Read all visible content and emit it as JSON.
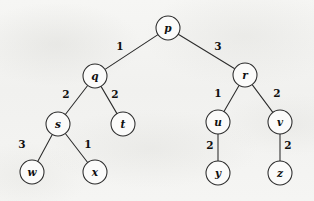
{
  "figure": {
    "type": "tree-diagram",
    "title": "",
    "background_color": "#f3f3f1",
    "stroke_color": "#2b2b2b",
    "node_fill_color": "#fbfbfa",
    "node_radius": 12
  },
  "nodes": [
    {
      "id": "p",
      "label": "p",
      "x": 168,
      "y": 28
    },
    {
      "id": "q",
      "label": "q",
      "x": 95,
      "y": 76
    },
    {
      "id": "r",
      "label": "r",
      "x": 245,
      "y": 75
    },
    {
      "id": "s",
      "label": "s",
      "x": 58,
      "y": 124
    },
    {
      "id": "t",
      "label": "t",
      "x": 123,
      "y": 124
    },
    {
      "id": "u",
      "label": "u",
      "x": 218,
      "y": 122
    },
    {
      "id": "v",
      "label": "v",
      "x": 280,
      "y": 122
    },
    {
      "id": "w",
      "label": "w",
      "x": 32,
      "y": 172
    },
    {
      "id": "x",
      "label": "x",
      "x": 95,
      "y": 172
    },
    {
      "id": "y",
      "label": "y",
      "x": 218,
      "y": 173
    },
    {
      "id": "z",
      "label": "z",
      "x": 280,
      "y": 173
    }
  ],
  "edges": [
    {
      "from": "p",
      "to": "q",
      "weight": "1",
      "label_x": 120,
      "label_y": 47
    },
    {
      "from": "p",
      "to": "r",
      "weight": "3",
      "label_x": 218,
      "label_y": 47
    },
    {
      "from": "q",
      "to": "s",
      "weight": "2",
      "label_x": 66,
      "label_y": 95
    },
    {
      "from": "q",
      "to": "t",
      "weight": "2",
      "label_x": 115,
      "label_y": 95
    },
    {
      "from": "r",
      "to": "u",
      "weight": "1",
      "label_x": 218,
      "label_y": 94
    },
    {
      "from": "r",
      "to": "v",
      "weight": "2",
      "label_x": 277,
      "label_y": 94
    },
    {
      "from": "s",
      "to": "w",
      "weight": "3",
      "label_x": 22,
      "label_y": 145
    },
    {
      "from": "s",
      "to": "x",
      "weight": "1",
      "label_x": 88,
      "label_y": 145
    },
    {
      "from": "u",
      "to": "y",
      "weight": "2",
      "label_x": 210,
      "label_y": 146
    },
    {
      "from": "v",
      "to": "z",
      "weight": "2",
      "label_x": 288,
      "label_y": 146
    }
  ]
}
